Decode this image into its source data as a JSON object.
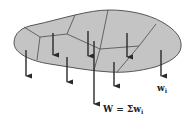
{
  "diagram": {
    "colors": {
      "fill": "#c4c4c4",
      "outline": "#555555",
      "partition_lines": "#4a4a4a",
      "arrows": "#2a2a2a",
      "text": "#222222"
    },
    "labels": {
      "element_weight": "w",
      "element_weight_sub": "i",
      "total_prefix": "W = Σw",
      "total_sub": "i"
    },
    "arrows": [
      {
        "x": 26,
        "y1": 50,
        "y2": 78
      },
      {
        "x": 53,
        "y1": 33,
        "y2": 57
      },
      {
        "x": 67,
        "y1": 57,
        "y2": 84
      },
      {
        "x": 88,
        "y1": 31,
        "y2": 58
      },
      {
        "x": 94,
        "y1": 41,
        "y2": 106
      },
      {
        "x": 114,
        "y1": 62,
        "y2": 88
      },
      {
        "x": 127,
        "y1": 33,
        "y2": 59
      },
      {
        "x": 161,
        "y1": 50,
        "y2": 78
      }
    ]
  }
}
